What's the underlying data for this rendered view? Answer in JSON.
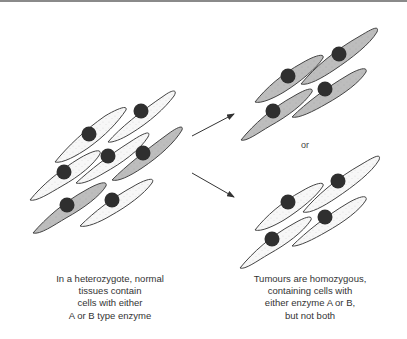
{
  "figure": {
    "left_group": {
      "description": "mixed tissue of light (enzyme A) and dark (enzyme B) cells",
      "cell_count": 8,
      "light_cells": 6,
      "shaded_cells": 2
    },
    "right_top_group": {
      "description": "tumour with all shaded cells",
      "cell_count": 4,
      "shade": "shaded"
    },
    "right_bottom_group": {
      "description": "tumour with all light cells",
      "cell_count": 4,
      "shade": "light"
    },
    "or_label": "or",
    "arrows": [
      "arrow-to-top-tumour",
      "arrow-to-bottom-tumour"
    ],
    "colors": {
      "light_cell": "#f6f6f6",
      "shaded_cell": "#bdbdbd",
      "nucleus": "#2f2f2f",
      "outline": "#444444"
    }
  },
  "captions": {
    "left": {
      "lines": [
        "In a heterozygote, normal",
        "tissues contain",
        "cells with either",
        "A or B type enzyme"
      ]
    },
    "right": {
      "lines": [
        "Tumours are homozygous,",
        "containing cells with",
        "either enzyme A or B,",
        "but not both"
      ]
    }
  }
}
